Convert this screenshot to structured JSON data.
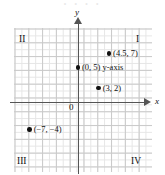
{
  "figure": {
    "top_faint_text": "• • • •",
    "origin_label": "0"
  },
  "axes": {
    "x_label": "x",
    "y_label": "y"
  },
  "quadrants": [
    {
      "name": "quadrant-1",
      "label": "I"
    },
    {
      "name": "quadrant-2",
      "label": "II"
    },
    {
      "name": "quadrant-3",
      "label": "III"
    },
    {
      "name": "quadrant-4",
      "label": "IV"
    }
  ],
  "points": [
    {
      "name": "point-4-5-7",
      "label": "(4.5, 7)",
      "x": 4.5,
      "y": 7
    },
    {
      "name": "point-0-5",
      "label": "(0, 5) y-axis",
      "x": 0,
      "y": 5
    },
    {
      "name": "point-3-2",
      "label": "(3, 2)",
      "x": 3,
      "y": 2
    },
    {
      "name": "point-neg7-neg4",
      "label": "(−7, −4)",
      "x": -7,
      "y": -4
    }
  ],
  "chart_data": {
    "type": "scatter",
    "title": "",
    "xlabel": "x",
    "ylabel": "y",
    "xlim": [
      -9,
      10
    ],
    "ylim": [
      -10,
      10
    ],
    "grid": true,
    "legend": "none",
    "unit_px": 6.9,
    "origin_px": {
      "x": 78,
      "y": 102
    },
    "points": [
      {
        "x": 4.5,
        "y": 7,
        "label": "(4.5, 7)"
      },
      {
        "x": 0,
        "y": 5,
        "label": "(0, 5) y-axis"
      },
      {
        "x": 3,
        "y": 2,
        "label": "(3, 2)"
      },
      {
        "x": -7,
        "y": -4,
        "label": "(−7, −4)"
      }
    ],
    "annotations": [
      {
        "text": "I",
        "position": "top-right"
      },
      {
        "text": "II",
        "position": "top-left"
      },
      {
        "text": "III",
        "position": "bottom-left"
      },
      {
        "text": "IV",
        "position": "bottom-right"
      },
      {
        "text": "0",
        "position": "origin"
      }
    ],
    "colors": {
      "point": "#111111",
      "axis": "#555555",
      "grid_major": "#c9c9c9",
      "grid_minor": "#e6e6e6"
    }
  }
}
